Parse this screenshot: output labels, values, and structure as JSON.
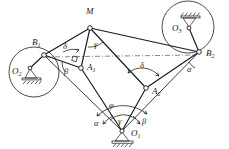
{
  "figure": {
    "background_color": "#ffffff",
    "line_color": "#1a1a1a",
    "width": 229,
    "height": 149
  },
  "points": {
    "M": {
      "label": "M",
      "sub": "",
      "x": 90,
      "y": 28,
      "label_x": 86,
      "label_y": 14
    },
    "B1": {
      "label": "B",
      "sub": "1",
      "x": 44,
      "y": 55,
      "label_x": 32,
      "label_y": 45
    },
    "B2": {
      "label": "B",
      "sub": "2",
      "x": 199,
      "y": 52,
      "label_x": 206,
      "label_y": 56
    },
    "A1": {
      "label": "A",
      "sub": "1",
      "x": 81,
      "y": 68,
      "label_x": 87,
      "label_y": 68
    },
    "A2": {
      "label": "A",
      "sub": "2",
      "x": 146,
      "y": 88,
      "label_x": 152,
      "label_y": 93
    },
    "O1": {
      "label": "O",
      "sub": "1",
      "x": 122,
      "y": 131,
      "label_x": 130,
      "label_y": 135
    },
    "O2": {
      "label": "O",
      "sub": "2",
      "x": 26,
      "y": 68,
      "label_x": 13,
      "label_y": 73
    },
    "O3": {
      "label": "O",
      "sub": "3",
      "x": 185,
      "y": 24,
      "label_x": 173,
      "label_y": 30
    }
  },
  "angles": [
    {
      "name": "gamma-at-M",
      "symbol": "γ",
      "x": 95,
      "y": 45
    },
    {
      "name": "delta-at-M",
      "symbol": "δ",
      "x": 69,
      "y": 48
    },
    {
      "name": "beta-at-A1",
      "symbol": "β",
      "x": 68,
      "y": 71
    },
    {
      "name": "delta-at-A2",
      "symbol": "δ",
      "x": 143,
      "y": 66
    },
    {
      "name": "alpha-at-B2",
      "symbol": "α",
      "x": 190,
      "y": 69
    },
    {
      "name": "phi-at-O1",
      "symbol": "φ",
      "x": 112,
      "y": 106
    },
    {
      "name": "gamma-at-O1",
      "symbol": "γ",
      "x": 121,
      "y": 120
    },
    {
      "name": "alpha-at-O1",
      "symbol": "α",
      "x": 98,
      "y": 121
    },
    {
      "name": "beta-at-O1",
      "symbol": "β",
      "x": 142,
      "y": 119
    }
  ],
  "circles": [
    {
      "name": "circle-O2",
      "cx": 34,
      "cy": 72,
      "r": 25
    },
    {
      "name": "circle-O3",
      "cx": 188,
      "cy": 27,
      "r": 26
    }
  ],
  "supports": [
    {
      "name": "ground-support-O1",
      "x": 122,
      "y": 131,
      "orientation": "up"
    },
    {
      "name": "ground-support-O2",
      "x": 31,
      "y": 72,
      "orientation": "up"
    },
    {
      "name": "ground-support-O3",
      "x": 190,
      "y": 22,
      "orientation": "down"
    }
  ],
  "links": [
    {
      "name": "link-M-B1",
      "from": "M",
      "to": "B1"
    },
    {
      "name": "link-M-B2",
      "from": "M",
      "to": "B2"
    },
    {
      "name": "link-M-A1",
      "from": "M",
      "to": "A1"
    },
    {
      "name": "link-M-A2",
      "from": "M",
      "to": "A2"
    },
    {
      "name": "link-B1-A1",
      "from": "B1",
      "to": "A1"
    },
    {
      "name": "link-A1-O1",
      "from": "A1",
      "to": "O1"
    },
    {
      "name": "link-A2-O1",
      "from": "A2",
      "to": "O1"
    },
    {
      "name": "link-A2-B2",
      "from": "A2",
      "to": "B2"
    },
    {
      "name": "link-B1-O2",
      "from": "B1",
      "to": "O2"
    },
    {
      "name": "link-B2-O3",
      "from": "B2",
      "to": "O3"
    },
    {
      "name": "link-B1-O1",
      "from": "B1",
      "to": "O1"
    },
    {
      "name": "link-B2-O1",
      "from": "B2",
      "to": "O1"
    }
  ],
  "dashdot_lines": [
    {
      "name": "axis-B1-B2",
      "x1": 44,
      "y1": 55,
      "x2": 199,
      "y2": 52
    }
  ]
}
